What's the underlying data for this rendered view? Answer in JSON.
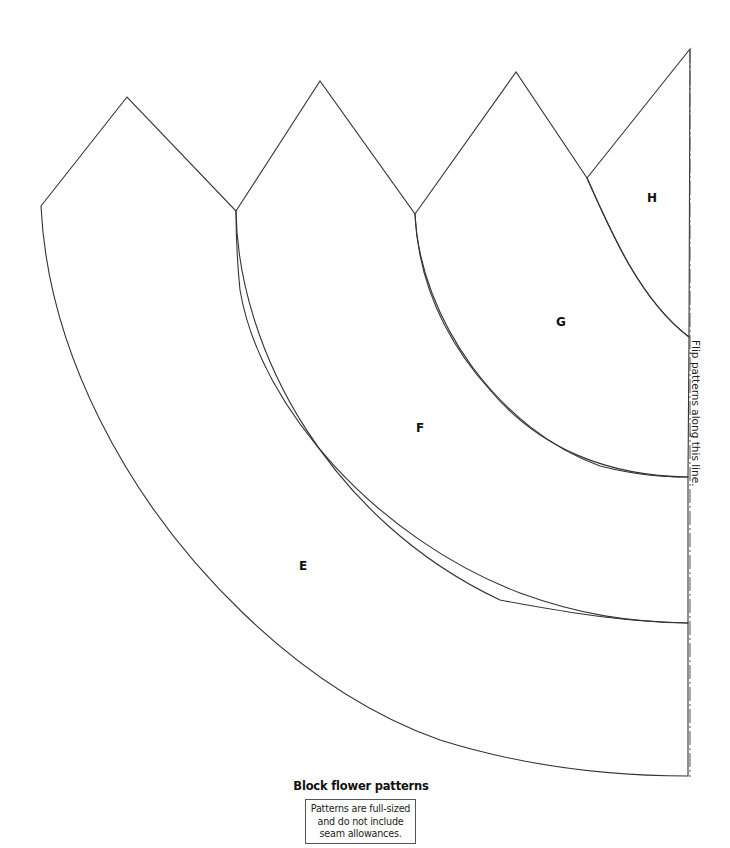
{
  "title": "Block flower patterns",
  "note": {
    "lines": [
      "Patterns are full-sized",
      "and do not include",
      "seam allowances."
    ]
  },
  "fold_line": {
    "label": "Flip patterns along this line.",
    "x": 690,
    "y_top": 49,
    "y_bottom": 777
  },
  "pieces": [
    {
      "id": "E",
      "label": "E",
      "label_pos": [
        303,
        570
      ],
      "path": "M41,206 L127,97 L236,211 C238,350 330,520 500,600 C580,615 630,622 688,623 L688,776 C600,776 520,765 440,740 C300,690 170,560 100,420 C60,340 44,270 41,206 Z"
    },
    {
      "id": "F",
      "label": "F",
      "label_pos": [
        420,
        432
      ],
      "path": "M236,211 L320,81 L415,214 C420,320 500,430 600,466 C640,476 665,477 688,477 L688,623 C630,622 580,615 520,593 C380,540 260,410 240,290 C237,260 236,235 236,211 Z"
    },
    {
      "id": "G",
      "label": "G",
      "label_pos": [
        561,
        326
      ],
      "path": "M415,214 L516,72 L587,178 C610,230 640,300 689,337 L688,477 C610,476 540,450 490,390 C445,340 418,280 415,214 Z"
    },
    {
      "id": "H",
      "label": "H",
      "label_pos": [
        652,
        202
      ],
      "path": "M587,178 L690,49 L689,337 C640,300 610,230 587,178 Z"
    }
  ]
}
